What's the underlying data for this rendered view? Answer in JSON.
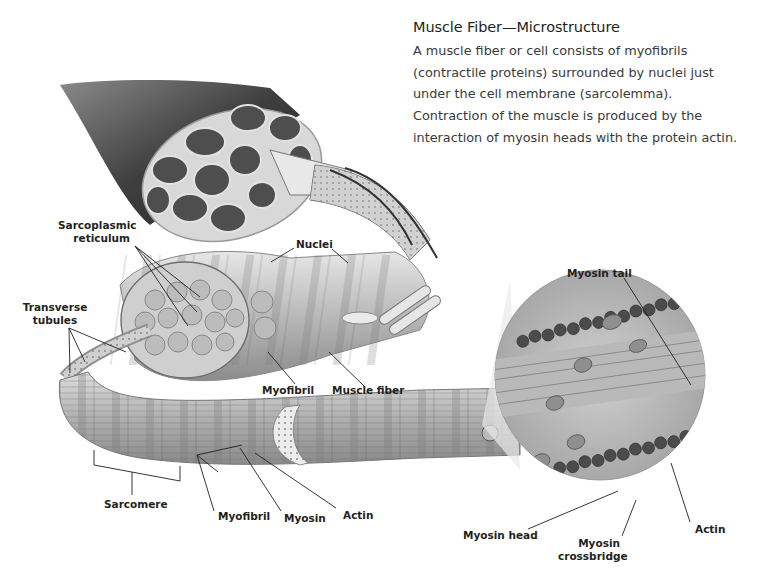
{
  "header": {
    "title": "Muscle Fiber—Microstructure",
    "description_lines": [
      "A muscle fiber or cell consists of myofibrils",
      "(contractile proteins) surrounded by nuclei just",
      "under the cell membrane (sarcolemma).",
      "Contraction of the muscle is produced by the",
      "interaction of myosin heads with the protein actin."
    ]
  },
  "labels": {
    "sarcoplasmic_reticulum": [
      "Sarcoplasmic",
      "reticulum"
    ],
    "nuclei": "Nuclei",
    "transverse_tubules": [
      "Transverse",
      "tubules"
    ],
    "myofibril_upper": "Myofibril",
    "muscle_fiber": "Muscle fiber",
    "myosin_tail": "Myosin tail",
    "sarcomere": "Sarcomere",
    "myofibril_lower": "Myofibril",
    "myosin": "Myosin",
    "actin_lower": "Actin",
    "myosin_head": "Myosin head",
    "myosin_crossbridge": [
      "Myosin",
      "crossbridge"
    ],
    "actin_right": "Actin"
  },
  "colors": {
    "background": "#ffffff",
    "text": "#231f20",
    "muscle_dark": "#4a4a4a",
    "fascicle": "#5c5c5c",
    "fiber_light": "#cfcfcf",
    "leader_line": "#231f20"
  }
}
